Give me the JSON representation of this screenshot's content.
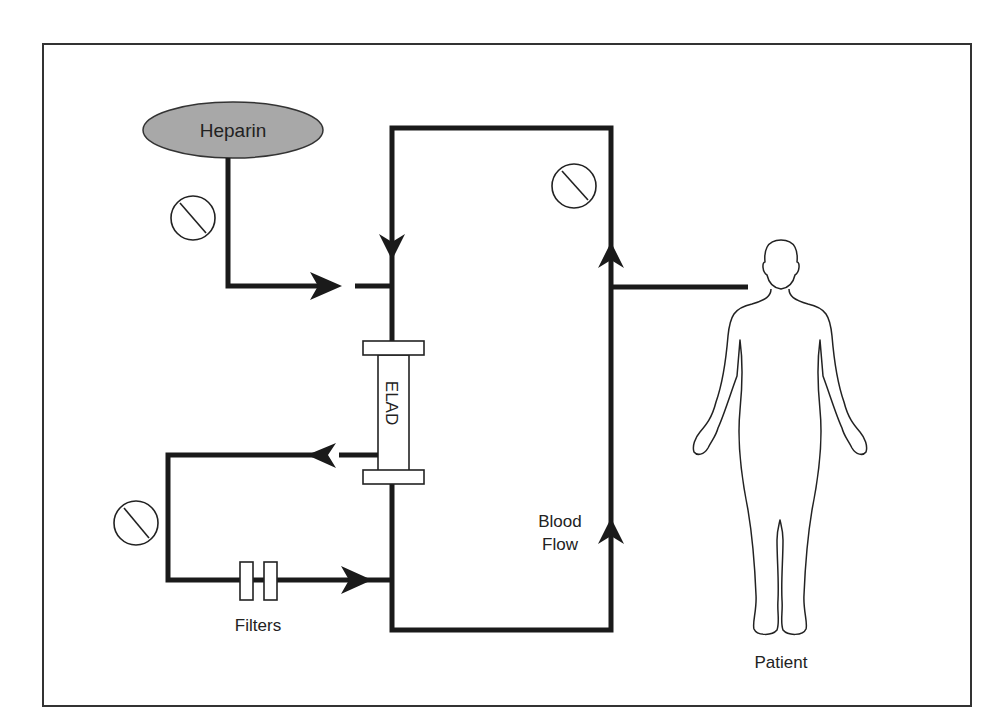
{
  "diagram": {
    "colors": {
      "line": "#1a1a1a",
      "heparin_fill": "#a8a8a8",
      "frame": "#333333"
    },
    "labels": {
      "heparin": "Heparin",
      "elad": "ELAD",
      "filters": "Filters",
      "blood_flow_line1": "Blood",
      "blood_flow_line2": "Flow",
      "patient": "Patient"
    },
    "nodes": [
      {
        "id": "heparin",
        "type": "ellipse",
        "label": "Heparin"
      },
      {
        "id": "elad",
        "type": "cartridge",
        "label": "ELAD"
      },
      {
        "id": "filters",
        "type": "filter-pair",
        "label": "Filters"
      },
      {
        "id": "patient",
        "type": "human-figure",
        "label": "Patient"
      },
      {
        "id": "pump-heparin",
        "type": "pump-symbol"
      },
      {
        "id": "pump-main",
        "type": "pump-symbol"
      },
      {
        "id": "pump-ultrafiltrate",
        "type": "pump-symbol"
      }
    ],
    "edges": [
      {
        "from": "heparin",
        "to": "main-circuit",
        "direction": "right"
      },
      {
        "from": "elad",
        "to": "filter-loop",
        "direction": "left"
      },
      {
        "from": "filters",
        "to": "main-circuit",
        "direction": "right"
      },
      {
        "from": "patient",
        "to": "main-circuit",
        "label": "Blood Flow",
        "direction": "up"
      }
    ]
  }
}
